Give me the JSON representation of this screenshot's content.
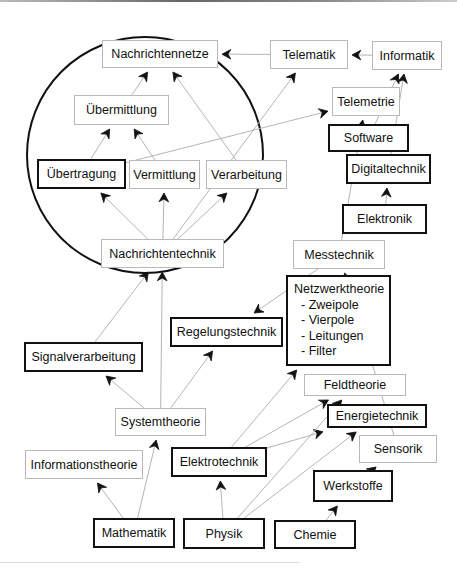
{
  "diagram": {
    "type": "concept-dependency-graph",
    "group": {
      "shape": "circle",
      "members": [
        "Nachrichtennetze",
        "Übermittlung",
        "Übertragung",
        "Vermittlung",
        "Verarbeitung",
        "Nachrichtentechnik"
      ]
    },
    "nodes": {
      "nachrichtennetze": {
        "label": "Nachrichtennetze",
        "style": "thin"
      },
      "telematik": {
        "label": "Telematik",
        "style": "thin"
      },
      "informatik": {
        "label": "Informatik",
        "style": "thin"
      },
      "uebermittlung": {
        "label": "Übermittlung",
        "style": "thin"
      },
      "telemetrie": {
        "label": "Telemetrie",
        "style": "thin"
      },
      "software": {
        "label": "Software",
        "style": "bold"
      },
      "uebertragung": {
        "label": "Übertragung",
        "style": "bold"
      },
      "vermittlung": {
        "label": "Vermittlung",
        "style": "thin"
      },
      "verarbeitung": {
        "label": "Verarbeitung",
        "style": "thin"
      },
      "digitaltechnik": {
        "label": "Digitaltechnik",
        "style": "bold"
      },
      "elektronik": {
        "label": "Elektronik",
        "style": "bold"
      },
      "nachrichtentechnik": {
        "label": "Nachrichtentechnik",
        "style": "thin"
      },
      "messtechnik": {
        "label": "Messtechnik",
        "style": "thin"
      },
      "netzwerktheorie": {
        "label": "Netzwerktheorie",
        "style": "bold",
        "items": [
          "- Zweipole",
          "- Vierpole",
          "- Leitungen",
          "- Filter"
        ]
      },
      "regelungstechnik": {
        "label": "Regelungstechnik",
        "style": "bold"
      },
      "signalverarbeitung": {
        "label": "Signalverarbeitung",
        "style": "bold"
      },
      "feldtheorie": {
        "label": "Feldtheorie",
        "style": "thin"
      },
      "energietechnik": {
        "label": "Energietechnik",
        "style": "bold"
      },
      "systemtheorie": {
        "label": "Systemtheorie",
        "style": "thin"
      },
      "sensorik": {
        "label": "Sensorik",
        "style": "thin"
      },
      "informationstheorie": {
        "label": "Informationstheorie",
        "style": "thin"
      },
      "elektrotechnik": {
        "label": "Elektrotechnik",
        "style": "bold"
      },
      "werkstoffe": {
        "label": "Werkstoffe",
        "style": "bold"
      },
      "mathematik": {
        "label": "Mathematik",
        "style": "bold"
      },
      "physik": {
        "label": "Physik",
        "style": "bold"
      },
      "chemie": {
        "label": "Chemie",
        "style": "bold"
      }
    },
    "edges": [
      {
        "from": "telematik",
        "to": "nachrichtennetze"
      },
      {
        "from": "informatik",
        "to": "telematik"
      },
      {
        "from": "uebermittlung",
        "to": "nachrichtennetze"
      },
      {
        "from": "verarbeitung",
        "to": "nachrichtennetze"
      },
      {
        "from": "uebertragung",
        "to": "uebermittlung"
      },
      {
        "from": "vermittlung",
        "to": "uebermittlung"
      },
      {
        "from": "uebertragung",
        "to": "telemetrie"
      },
      {
        "from": "nachrichtentechnik",
        "to": "uebertragung"
      },
      {
        "from": "nachrichtentechnik",
        "to": "vermittlung"
      },
      {
        "from": "nachrichtentechnik",
        "to": "verarbeitung"
      },
      {
        "from": "nachrichtentechnik",
        "to": "telematik"
      },
      {
        "from": "messtechnik",
        "to": "telemetrie"
      },
      {
        "from": "software",
        "to": "informatik"
      },
      {
        "from": "digitaltechnik",
        "to": "informatik"
      },
      {
        "from": "elektronik",
        "to": "digitaltechnik"
      },
      {
        "from": "messtechnik",
        "to": "regelungstechnik"
      },
      {
        "from": "signalverarbeitung",
        "to": "nachrichtentechnik"
      },
      {
        "from": "systemtheorie",
        "to": "nachrichtentechnik"
      },
      {
        "from": "systemtheorie",
        "to": "signalverarbeitung"
      },
      {
        "from": "systemtheorie",
        "to": "regelungstechnik"
      },
      {
        "from": "mathematik",
        "to": "systemtheorie"
      },
      {
        "from": "mathematik",
        "to": "informationstheorie"
      },
      {
        "from": "physik",
        "to": "elektrotechnik"
      },
      {
        "from": "elektrotechnik",
        "to": "netzwerktheorie"
      },
      {
        "from": "elektrotechnik",
        "to": "feldtheorie"
      },
      {
        "from": "elektrotechnik",
        "to": "energietechnik"
      },
      {
        "from": "physik",
        "to": "feldtheorie"
      },
      {
        "from": "physik",
        "to": "energietechnik"
      },
      {
        "from": "chemie",
        "to": "werkstoffe"
      },
      {
        "from": "werkstoffe",
        "to": "sensorik"
      },
      {
        "from": "sensorik",
        "to": "messtechnik"
      }
    ]
  }
}
